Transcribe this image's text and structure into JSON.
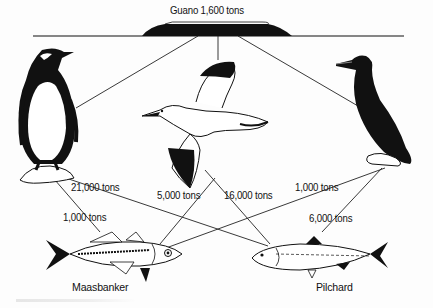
{
  "diagram": {
    "type": "food-web",
    "guano": {
      "label": "Guano 1,600 tons"
    },
    "predators": [
      {
        "id": "penguin",
        "name": "penguin"
      },
      {
        "id": "gannet",
        "name": "gannet"
      },
      {
        "id": "cormorant",
        "name": "cormorant"
      }
    ],
    "prey": [
      {
        "id": "maasbanker",
        "label": "Maasbanker"
      },
      {
        "id": "pilchard",
        "label": "Pilchard"
      }
    ],
    "flows": [
      {
        "from": "penguin",
        "to": "pilchard",
        "label": "21,000 tons"
      },
      {
        "from": "penguin",
        "to": "maasbanker",
        "label": "1,000 tons"
      },
      {
        "from": "gannet",
        "to": "maasbanker",
        "label": "5,000 tons"
      },
      {
        "from": "gannet",
        "to": "pilchard",
        "label": "16,000 tons"
      },
      {
        "from": "cormorant",
        "to": "maasbanker",
        "label": "1,000 tons"
      },
      {
        "from": "cormorant",
        "to": "pilchard",
        "label": "6,000 tons"
      }
    ],
    "colors": {
      "ink": "#111111",
      "paper": "#fdfdfd"
    }
  }
}
